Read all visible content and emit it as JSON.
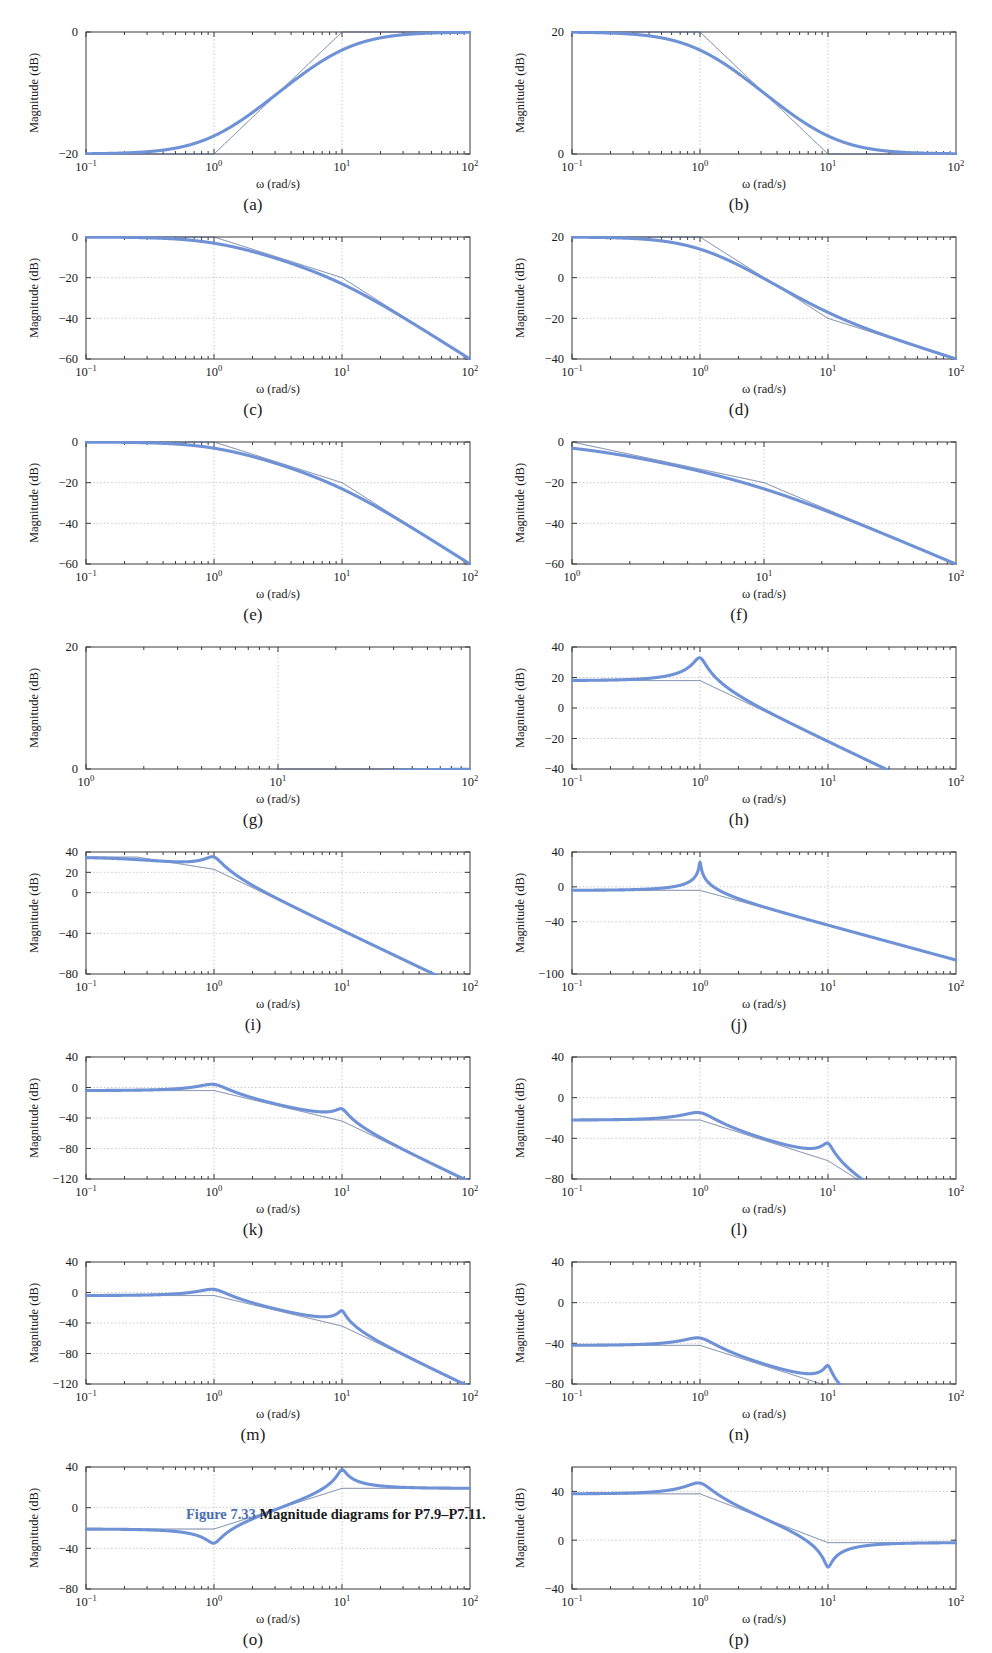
{
  "figure": {
    "caption_number": "Figure 7.33",
    "caption_text": "Magnitude diagrams for P7.9–P7.11.",
    "axis_label_x": "ω (rad/s)",
    "axis_label_y": "Magnitude (dB)",
    "curve_color": "#6f92d6",
    "asymptote_color": "#4a5f8e",
    "axis_color": "#3a3a3a",
    "grid_color": "#b9b9b9"
  },
  "chart_data": [
    {
      "id": "a",
      "type": "line",
      "label": "(a)",
      "title": "",
      "xlabel": "ω (rad/s)",
      "ylabel": "Magnitude (dB)",
      "xscale": "log",
      "xlim": [
        0.1,
        100
      ],
      "ylim": [
        -20,
        0
      ],
      "xticks": [
        0.1,
        1,
        10,
        100
      ],
      "xticklabels": [
        "10^-1",
        "10^0",
        "10^1",
        "10^2"
      ],
      "yticks": [
        -20,
        0
      ],
      "yticklabels": [
        "-20",
        "0"
      ],
      "gridlines_x": [
        1,
        10
      ],
      "gridlines_y": [],
      "zeros_real": [
        1
      ],
      "poles_real": [
        10
      ],
      "zeros_quad": [],
      "poles_quad": [],
      "gain_db": -20,
      "series": [
        {
          "name": "exact magnitude",
          "style": "thick"
        },
        {
          "name": "asymptotic approximation",
          "style": "thin"
        }
      ],
      "description": "Low-frequency asymptote -20 dB, +20 dB/dec break at 1 rad/s, levels at 0 dB after 10 rad/s"
    },
    {
      "id": "b",
      "type": "line",
      "label": "(b)",
      "xlabel": "ω (rad/s)",
      "ylabel": "Magnitude (dB)",
      "xscale": "log",
      "xlim": [
        0.1,
        100
      ],
      "ylim": [
        0,
        20
      ],
      "xticks": [
        0.1,
        1,
        10,
        100
      ],
      "xticklabels": [
        "10^-1",
        "10^0",
        "10^1",
        "10^2"
      ],
      "yticks": [
        0,
        20
      ],
      "yticklabels": [
        "0",
        "20"
      ],
      "gridlines_x": [
        1,
        10
      ],
      "gridlines_y": [],
      "zeros_real": [
        10
      ],
      "poles_real": [
        1
      ],
      "zeros_quad": [],
      "poles_quad": [],
      "gain_db": 20,
      "description": "Starts at 20 dB, -20 dB/dec break at 1 rad/s, flattens at 0 dB after 10 rad/s"
    },
    {
      "id": "c",
      "type": "line",
      "label": "(c)",
      "xlabel": "ω (rad/s)",
      "ylabel": "Magnitude (dB)",
      "xscale": "log",
      "xlim": [
        0.1,
        100
      ],
      "ylim": [
        -60,
        0
      ],
      "xticks": [
        0.1,
        1,
        10,
        100
      ],
      "xticklabels": [
        "10^-1",
        "10^0",
        "10^1",
        "10^2"
      ],
      "yticks": [
        -60,
        -40,
        -20,
        0
      ],
      "yticklabels": [
        "-60",
        "-40",
        "-20",
        "0"
      ],
      "gridlines_x": [
        1,
        10
      ],
      "gridlines_y": [
        -40,
        -20
      ],
      "zeros_real": [],
      "poles_real": [
        1,
        10
      ],
      "zeros_quad": [],
      "poles_quad": [],
      "gain_db": 0,
      "description": "0 dB flat, -20 dB/dec after 1 rad/s, -40 dB/dec after 10 rad/s, reaching -60 dB at 100"
    },
    {
      "id": "d",
      "type": "line",
      "label": "(d)",
      "xlabel": "ω (rad/s)",
      "ylabel": "Magnitude (dB)",
      "xscale": "log",
      "xlim": [
        0.1,
        100
      ],
      "ylim": [
        -40,
        20
      ],
      "xticks": [
        0.1,
        1,
        10,
        100
      ],
      "xticklabels": [
        "10^-1",
        "10^0",
        "10^1",
        "10^2"
      ],
      "yticks": [
        -40,
        -20,
        0,
        20
      ],
      "yticklabels": [
        "-40",
        "-20",
        "0",
        "20"
      ],
      "gridlines_x": [
        1,
        10
      ],
      "gridlines_y": [
        -20,
        0
      ],
      "zeros_real": [
        10
      ],
      "poles_real": [
        1,
        1
      ],
      "zeros_quad": [],
      "poles_quad": [],
      "gain_db": 20,
      "description": "20 dB flat, -40 dB/dec after 1 rad/s, -20 dB/dec after 10 rad/s, ends near -40 dB"
    },
    {
      "id": "e",
      "type": "line",
      "label": "(e)",
      "xlabel": "ω (rad/s)",
      "ylabel": "Magnitude (dB)",
      "xscale": "log",
      "xlim": [
        0.1,
        100
      ],
      "ylim": [
        -60,
        0
      ],
      "xticks": [
        0.1,
        1,
        10,
        100
      ],
      "xticklabels": [
        "10^-1",
        "10^0",
        "10^1",
        "10^2"
      ],
      "yticks": [
        -60,
        -40,
        -20,
        0
      ],
      "yticklabels": [
        "-60",
        "-40",
        "-20",
        "0"
      ],
      "gridlines_x": [
        1,
        10
      ],
      "gridlines_y": [
        -40,
        -20
      ],
      "zeros_real": [],
      "poles_real": [
        1,
        10
      ],
      "zeros_quad": [],
      "poles_quad": [],
      "gain_db": 0,
      "description": "0 dB flat, -20 dB/dec after 1 rad/s, -40 dB/dec after 10 rad/s"
    },
    {
      "id": "f",
      "type": "line",
      "label": "(f)",
      "xlabel": "ω (rad/s)",
      "ylabel": "Magnitude (dB)",
      "xscale": "log",
      "xlim": [
        1,
        100
      ],
      "ylim": [
        -60,
        0
      ],
      "xticks": [
        1,
        10,
        100
      ],
      "xticklabels": [
        "10^0",
        "10^1",
        "10^2"
      ],
      "yticks": [
        -60,
        -40,
        -20,
        0
      ],
      "yticklabels": [
        "-60",
        "-40",
        "-20",
        "0"
      ],
      "gridlines_x": [
        10
      ],
      "gridlines_y": [
        -40,
        -20
      ],
      "zeros_real": [],
      "poles_real": [
        1,
        10
      ],
      "zeros_quad": [],
      "poles_quad": [],
      "gain_db": 0,
      "description": "Starts 0 dB at 1 rad/s, -20 dB/dec then -40 dB/dec past 10 rad/s"
    },
    {
      "id": "g",
      "type": "line",
      "label": "(g)",
      "xlabel": "ω (rad/s)",
      "ylabel": "Magnitude (dB)",
      "xscale": "log",
      "xlim": [
        1,
        100
      ],
      "ylim": [
        0,
        20
      ],
      "xticks": [
        1,
        10,
        100
      ],
      "xticklabels": [
        "10^0",
        "10^1",
        "10^2"
      ],
      "yticks": [
        0,
        20
      ],
      "yticklabels": [
        "0",
        "20"
      ],
      "gridlines_x": [
        10
      ],
      "gridlines_y": [],
      "zeros_real": [
        1
      ],
      "poles_real": [
        10
      ],
      "zeros_quad": [],
      "poles_quad": [],
      "gain_db": -20,
      "description": "Rises from 0 dB at 1 rad/s at +20 dB/dec, flattens at 20 dB after 10 rad/s"
    },
    {
      "id": "h",
      "type": "line",
      "label": "(h)",
      "xlabel": "ω (rad/s)",
      "ylabel": "Magnitude (dB)",
      "xscale": "log",
      "xlim": [
        0.1,
        100
      ],
      "ylim": [
        -40,
        40
      ],
      "xticks": [
        0.1,
        1,
        10,
        100
      ],
      "xticklabels": [
        "10^-1",
        "10^0",
        "10^1",
        "10^2"
      ],
      "yticks": [
        -40,
        -20,
        0,
        20,
        40
      ],
      "yticklabels": [
        "-40",
        "-20",
        "0",
        "20",
        "40"
      ],
      "gridlines_x": [
        1,
        10
      ],
      "gridlines_y": [
        -20,
        0,
        20
      ],
      "zeros_real": [],
      "poles_real": [],
      "zeros_quad": [],
      "poles_quad": [
        {
          "wn": 1,
          "zeta": 0.09
        }
      ],
      "gain_db": 18,
      "peak_db": 35,
      "peak_w": 1,
      "description": "18 dB flat with lightly damped resonance peak ~35 dB at 1 rad/s, then -40 dB/dec"
    },
    {
      "id": "i",
      "type": "line",
      "label": "(i)",
      "xlabel": "ω (rad/s)",
      "ylabel": "Magnitude (dB)",
      "xscale": "log",
      "xlim": [
        0.1,
        100
      ],
      "ylim": [
        -80,
        40
      ],
      "xticks": [
        0.1,
        1,
        10,
        100
      ],
      "xticklabels": [
        "10^-1",
        "10^0",
        "10^1",
        "10^2"
      ],
      "yticks": [
        -80,
        -40,
        0,
        20,
        40
      ],
      "yticklabels": [
        "-80",
        "-40",
        "0",
        "20",
        "40"
      ],
      "gridlines_x": [
        1,
        10
      ],
      "gridlines_y": [
        -40,
        0,
        20
      ],
      "zeros_real": [],
      "poles_real": [
        0.25
      ],
      "zeros_quad": [],
      "poles_quad": [
        {
          "wn": 1,
          "zeta": 0.12
        }
      ],
      "gain_db": 35,
      "peak_db": 32,
      "peak_w": 1,
      "description": "35 dB at 0.1, gentle roll to a resonance bump ~32 dB at 1 rad/s, then steady -40 dB/dec to -80 dB"
    },
    {
      "id": "j",
      "type": "line",
      "label": "(j)",
      "xlabel": "ω (rad/s)",
      "ylabel": "Magnitude (dB)",
      "xscale": "log",
      "xlim": [
        0.1,
        100
      ],
      "ylim": [
        -100,
        40
      ],
      "xticks": [
        0.1,
        1,
        10,
        100
      ],
      "xticklabels": [
        "10^-1",
        "10^0",
        "10^1",
        "10^2"
      ],
      "yticks": [
        -100,
        -40,
        0,
        40
      ],
      "yticklabels": [
        "-100",
        "-40",
        "0",
        "40"
      ],
      "gridlines_x": [
        1,
        10
      ],
      "gridlines_y": [
        -40,
        0
      ],
      "zeros_real": [],
      "poles_real": [],
      "zeros_quad": [],
      "poles_quad": [
        {
          "wn": 1,
          "zeta": 0.012
        }
      ],
      "gain_db": -4,
      "peak_db": 38,
      "peak_w": 1,
      "description": "Flat near -4 dB with a very sharp resonance spike to ~38 dB at 1 rad/s, then -40 dB/dec to -100 dB"
    },
    {
      "id": "k",
      "type": "line",
      "label": "(k)",
      "xlabel": "ω (rad/s)",
      "ylabel": "Magnitude (dB)",
      "xscale": "log",
      "xlim": [
        0.1,
        100
      ],
      "ylim": [
        -120,
        40
      ],
      "xticks": [
        0.1,
        1,
        10,
        100
      ],
      "xticklabels": [
        "10^-1",
        "10^0",
        "10^1",
        "10^2"
      ],
      "yticks": [
        -120,
        -80,
        -40,
        0,
        40
      ],
      "yticklabels": [
        "-120",
        "-80",
        "-40",
        "0",
        "40"
      ],
      "gridlines_x": [
        1,
        10
      ],
      "gridlines_y": [
        -80,
        -40,
        0
      ],
      "zeros_real": [],
      "poles_real": [],
      "zeros_quad": [],
      "poles_quad": [
        {
          "wn": 1,
          "zeta": 0.2
        },
        {
          "wn": 10,
          "zeta": 0.08
        }
      ],
      "gain_db": -4,
      "peaks": [
        {
          "w": 1,
          "db": 9
        },
        {
          "w": 10,
          "db": -24
        }
      ],
      "description": "Flat -4 dB, resonance peak ~9 dB at 1 rad/s, second peak ~-24 dB at 10 rad/s, -80 dB/dec to -120 dB"
    },
    {
      "id": "l",
      "type": "line",
      "label": "(l)",
      "xlabel": "ω (rad/s)",
      "ylabel": "Magnitude (dB)",
      "xscale": "log",
      "xlim": [
        0.1,
        100
      ],
      "ylim": [
        -80,
        40
      ],
      "xticks": [
        0.1,
        1,
        10,
        100
      ],
      "xticklabels": [
        "10^-1",
        "10^0",
        "10^1",
        "10^2"
      ],
      "yticks": [
        -80,
        -40,
        0,
        40
      ],
      "yticklabels": [
        "-80",
        "-40",
        "0",
        "40"
      ],
      "gridlines_x": [
        1,
        10
      ],
      "gridlines_y": [
        -40,
        0
      ],
      "zeros_real": [],
      "poles_real": [],
      "zeros_quad": [],
      "poles_quad": [
        {
          "wn": 1,
          "zeta": 0.22
        },
        {
          "wn": 10,
          "zeta": 0.07
        }
      ],
      "gain_db": -22,
      "peaks": [
        {
          "w": 1,
          "db": 11
        },
        {
          "w": 10,
          "db": 11
        }
      ],
      "description": "Rises +20 dB/dec from -22 dB, peak ~11 dB at 1 rad/s, second sharp peak ~11 dB at 10 rad/s, then -40 dB/dec to -80 dB"
    },
    {
      "id": "m",
      "type": "line",
      "label": "(m)",
      "xlabel": "ω (rad/s)",
      "ylabel": "Magnitude (dB)",
      "xscale": "log",
      "xlim": [
        0.1,
        100
      ],
      "ylim": [
        -120,
        40
      ],
      "xticks": [
        0.1,
        1,
        10,
        100
      ],
      "xticklabels": [
        "10^-1",
        "10^0",
        "10^1",
        "10^2"
      ],
      "yticks": [
        -120,
        -80,
        -40,
        0,
        40
      ],
      "yticklabels": [
        "-120",
        "-80",
        "-40",
        "0",
        "40"
      ],
      "gridlines_x": [
        1,
        10
      ],
      "gridlines_y": [
        -80,
        -40,
        0
      ],
      "zeros_real": [],
      "poles_real": [],
      "zeros_quad": [],
      "poles_quad": [
        {
          "wn": 1,
          "zeta": 0.2
        },
        {
          "wn": 10,
          "zeta": 0.05
        }
      ],
      "gain_db": -4,
      "peaks": [
        {
          "w": 1,
          "db": 11
        },
        {
          "w": 10,
          "db": -9
        }
      ],
      "description": "Flat -4 dB, peak ~11 dB at 1 rad/s, sharp peak ~-9 dB at 10 rad/s, then -80 dB/dec to -120 dB"
    },
    {
      "id": "n",
      "type": "line",
      "label": "(n)",
      "xlabel": "ω (rad/s)",
      "ylabel": "Magnitude (dB)",
      "xscale": "log",
      "xlim": [
        0.1,
        100
      ],
      "ylim": [
        -80,
        40
      ],
      "xticks": [
        0.1,
        1,
        10,
        100
      ],
      "xticklabels": [
        "10^-1",
        "10^0",
        "10^1",
        "10^2"
      ],
      "yticks": [
        -80,
        -40,
        0,
        40
      ],
      "yticklabels": [
        "-80",
        "-40",
        "0",
        "40"
      ],
      "gridlines_x": [
        1,
        10
      ],
      "gridlines_y": [
        -40,
        0
      ],
      "zeros_real": [],
      "poles_real": [],
      "zeros_quad": [],
      "poles_quad": [
        {
          "wn": 1,
          "zeta": 0.22
        },
        {
          "wn": 10,
          "zeta": 0.05
        }
      ],
      "gain_db": -42,
      "peaks": [
        {
          "w": 1,
          "db": 11
        },
        {
          "w": 10,
          "db": 30
        }
      ],
      "description": "Rises +20 dB/dec from -42 dB, peak ~11 dB at 1 rad/s, flat band, tall sharp peak ~30 dB at 10 rad/s, then -20 dB/dec to -43 dB"
    },
    {
      "id": "o",
      "type": "line",
      "label": "(o)",
      "xlabel": "ω (rad/s)",
      "ylabel": "Magnitude (dB)",
      "xscale": "log",
      "xlim": [
        0.1,
        100
      ],
      "ylim": [
        -80,
        40
      ],
      "xticks": [
        0.1,
        1,
        10,
        100
      ],
      "xticklabels": [
        "10^-1",
        "10^0",
        "10^1",
        "10^2"
      ],
      "yticks": [
        -80,
        -40,
        0,
        40
      ],
      "yticklabels": [
        "-80",
        "-40",
        "0",
        "40"
      ],
      "gridlines_x": [
        1,
        10
      ],
      "gridlines_y": [
        -40,
        0
      ],
      "zeros_real": [],
      "poles_real": [],
      "zeros_quad": [
        {
          "wn": 1,
          "zeta": 0.1
        }
      ],
      "poles_quad": [
        {
          "wn": 10,
          "zeta": 0.06
        }
      ],
      "gain_db": -21,
      "notch": {
        "w": 1,
        "db": -57
      },
      "peaks": [
        {
          "w": 10,
          "db": 11
        }
      ],
      "description": "Starts -21 dB, notch dip to ~-57 dB at 1 rad/s, rises to sharp peak ~11 dB at 10 rad/s, then decays to -43 dB"
    },
    {
      "id": "p",
      "type": "line",
      "label": "(p)",
      "xlabel": "ω (rad/s)",
      "ylabel": "Magnitude (dB)",
      "xscale": "log",
      "xlim": [
        0.1,
        100
      ],
      "ylim": [
        -40,
        60
      ],
      "xticks": [
        0.1,
        1,
        10,
        100
      ],
      "xticklabels": [
        "10^-1",
        "10^0",
        "10^1",
        "10^2"
      ],
      "yticks": [
        -40,
        0,
        40
      ],
      "yticklabels": [
        "-40",
        "0",
        "40"
      ],
      "gridlines_x": [
        1,
        10
      ],
      "gridlines_y": [
        0,
        40
      ],
      "zeros_real": [],
      "poles_real": [],
      "zeros_quad": [
        {
          "wn": 10,
          "zeta": 0.05
        }
      ],
      "poles_quad": [
        {
          "wn": 1,
          "zeta": 0.18
        }
      ],
      "gain_db": 38,
      "peaks": [
        {
          "w": 1,
          "db": 50
        }
      ],
      "notch": {
        "w": 10,
        "db": -38
      },
      "description": "38 dB flat, resonance peak ~50 dB at 1 rad/s, falls -40 dB/dec, deep notch to -38 dB at 10 rad/s, then flat near -3 dB"
    }
  ]
}
